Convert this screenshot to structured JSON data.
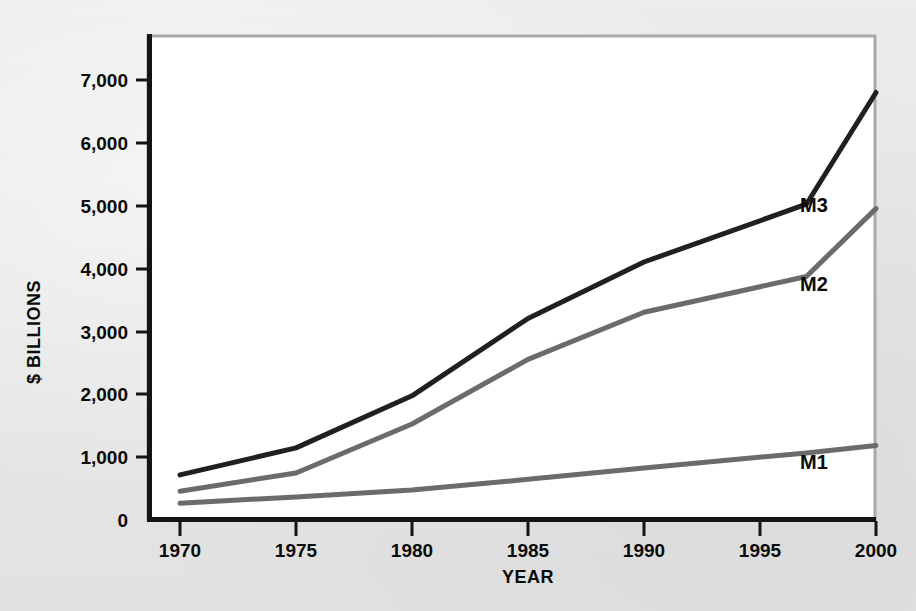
{
  "chart_data": {
    "type": "line",
    "title": "",
    "xlabel": "YEAR",
    "ylabel": "$ BILLIONS",
    "x": [
      1970,
      1975,
      1980,
      1985,
      1990,
      1997,
      2000
    ],
    "xlim": [
      1968.5,
      2001.5
    ],
    "ylim": [
      0,
      7500
    ],
    "xticks": [
      1970,
      1975,
      1980,
      1985,
      1990,
      1995,
      2000
    ],
    "xtick_labels": [
      "1970",
      "1975",
      "1980",
      "1985",
      "1990",
      "1995",
      "2000"
    ],
    "yticks": [
      0,
      1000,
      2000,
      3000,
      4000,
      5000,
      6000,
      7000
    ],
    "ytick_labels": [
      "0",
      "1,000",
      "2,000",
      "3,000",
      "4,000",
      "5,000",
      "6,000",
      "7,000"
    ],
    "grid": false,
    "legend_position": "inline-right",
    "series": [
      {
        "name": "M3",
        "label": "M3",
        "color": "#231f20",
        "values": [
          710,
          1140,
          1970,
          3200,
          4100,
          5020,
          6800
        ]
      },
      {
        "name": "M2",
        "label": "M2",
        "color": "#6b6b6b",
        "values": [
          450,
          740,
          1520,
          2550,
          3300,
          3870,
          4950
        ]
      },
      {
        "name": "M1",
        "label": "M1",
        "color": "#6b6b6b",
        "values": [
          260,
          360,
          470,
          640,
          820,
          1060,
          1180
        ]
      }
    ]
  },
  "axes": {
    "y_title": "$ BILLIONS",
    "x_title": "YEAR",
    "ytick_labels": [
      "7,000",
      "6,000",
      "5,000",
      "4,000",
      "3,000",
      "2,000",
      "1,000",
      "0"
    ],
    "xtick_labels": [
      "1970",
      "1975",
      "1980",
      "1985",
      "1990",
      "1995",
      "2000"
    ]
  },
  "series_labels": {
    "m3": "M3",
    "m2": "M2",
    "m1": "M1"
  },
  "colors": {
    "background": "#e8e8e8",
    "plot_background": "#ffffff",
    "axis": "#141414",
    "frame": "#a8a8a8",
    "m3_line": "#231f20",
    "m2_line": "#6b6b6b",
    "m1_line": "#6b6b6b",
    "text": "#0a0a0a"
  }
}
